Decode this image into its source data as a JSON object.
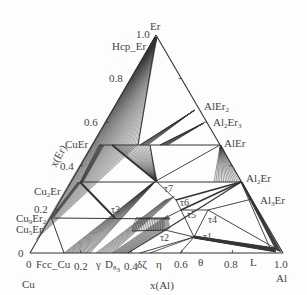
{
  "diagram": {
    "type": "ternary-phase-diagram",
    "corners": {
      "bottom_left": "Cu",
      "bottom_right": "Al",
      "top": "Er"
    },
    "axes": {
      "x_label": "x(Al)",
      "y_label": "x(Er)",
      "x_ticks": [
        "0",
        "0.2",
        "0.4",
        "0.6",
        "0.8",
        "1.0"
      ],
      "y_ticks": [
        "0",
        "0.2",
        "0.4",
        "0.6",
        "0.8",
        "1.0"
      ]
    },
    "phase_labels": {
      "hcp_er": "Hcp_Er",
      "cuer": "CuEr",
      "cu2er": "Cu2Er",
      "cu9er2": "Cu9Er2",
      "cu5er": "Cu5Er",
      "fcc_cu": "Fcc_Cu",
      "gamma": "γ",
      "d83": "D83",
      "delta_zeta": "δζ",
      "eta": "η",
      "theta": "θ",
      "liquid": "L",
      "alel2": "AlEr2",
      "al2er3": "Al2Er3",
      "aler": "AlEr",
      "al2er": "Al2Er",
      "al3er": "Al3Er",
      "tau1": "τ1",
      "tau2": "τ2",
      "tau3": "τ3",
      "tau4": "τ4",
      "tau5": "τ5",
      "tau6": "τ6",
      "tau7": "τ7"
    },
    "line_color": "#333333",
    "text_color": "#444444"
  }
}
